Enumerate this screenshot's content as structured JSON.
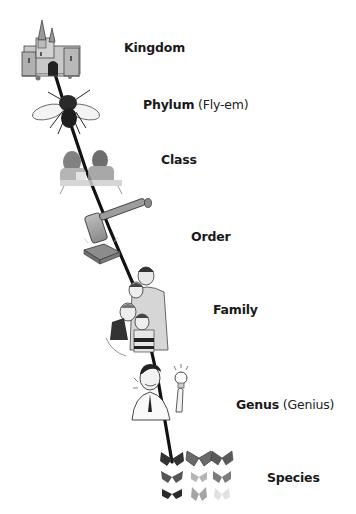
{
  "diagram": {
    "type": "taxonomy-ladder",
    "line_color": "#111111",
    "levels": [
      {
        "rank": "Kingdom",
        "mnemonic": "",
        "icon": "castle-icon"
      },
      {
        "rank": "Phylum",
        "mnemonic": "(Fly-em)",
        "icon": "fly-icon"
      },
      {
        "rank": "Class",
        "mnemonic": "",
        "icon": "classroom-students-icon"
      },
      {
        "rank": "Order",
        "mnemonic": "",
        "icon": "gavel-icon"
      },
      {
        "rank": "Family",
        "mnemonic": "",
        "icon": "family-portrait-icon"
      },
      {
        "rank": "Genus",
        "mnemonic": "(Genius)",
        "icon": "genius-lightbulb-icon"
      },
      {
        "rank": "Species",
        "mnemonic": "",
        "icon": "butterflies-grid-icon"
      }
    ]
  }
}
